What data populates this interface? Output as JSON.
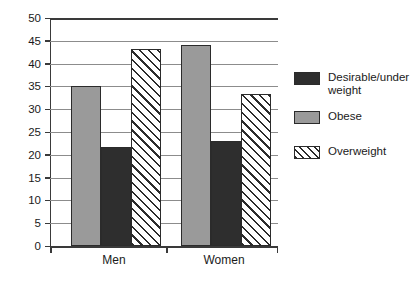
{
  "chart_data": {
    "type": "bar",
    "title": "",
    "subtitle": "",
    "xlabel": "",
    "ylabel": "",
    "categories": [
      "Men",
      "Women"
    ],
    "series": [
      {
        "name": "Obese",
        "style": "gray",
        "color": "#9a9a9a",
        "values": [
          35.0,
          44.1
        ]
      },
      {
        "name": "Desirable/under weight",
        "style": "dark",
        "color": "#2e2e2e",
        "values": [
          21.8,
          23.1
        ]
      },
      {
        "name": "Overweight",
        "style": "hatch",
        "color": "#ffffff",
        "values": [
          43.1,
          33.3
        ]
      }
    ],
    "ylim": [
      0,
      50
    ],
    "ytick_step": 5,
    "yticks": [
      0,
      5,
      10,
      15,
      20,
      25,
      30,
      35,
      40,
      45,
      50
    ],
    "ytick_labels": [
      "0",
      "5",
      "10",
      "15",
      "20",
      "25",
      "30",
      "35",
      "40",
      "45",
      "50"
    ],
    "grid": true,
    "grid_axis": "y",
    "legend_position": "right",
    "bar_order_in_group": [
      "Obese",
      "Desirable/under weight",
      "Overweight"
    ]
  },
  "legend": {
    "entries": [
      {
        "label": "Desirable/under weight",
        "style": "dark"
      },
      {
        "label": "Obese",
        "style": "gray"
      },
      {
        "label": "Overweight",
        "style": "hatch"
      }
    ]
  },
  "axes": {
    "x_categories": [
      "Men",
      "Women"
    ],
    "y_tick_labels": [
      "50",
      "45",
      "40",
      "35",
      "30",
      "25",
      "20",
      "15",
      "10",
      "5",
      "0"
    ]
  },
  "colors": {
    "gray_fill": "#9a9a9a",
    "dark_fill": "#2e2e2e",
    "hatch_fill": "#ffffff",
    "outline": "#2b2b2b",
    "gridline": "#8c8c8c",
    "axis": "#3a3a3a",
    "background": "#ffffff"
  }
}
